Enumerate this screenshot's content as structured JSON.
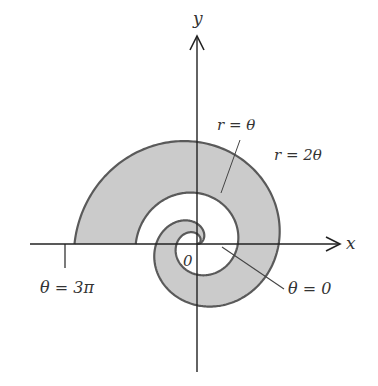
{
  "figure": {
    "type": "polar-region-diagram",
    "axes": {
      "x_label": "x",
      "y_label": "y",
      "origin_label": "0"
    },
    "curves": [
      {
        "label": "r = θ",
        "equation": "r = theta"
      },
      {
        "label": "r = 2θ",
        "equation": "r = 2 theta"
      }
    ],
    "annotations": [
      {
        "label": "θ = 3π",
        "position": "negative x-axis"
      },
      {
        "label": "θ = 0",
        "position": "positive x-axis"
      }
    ],
    "theta_range": [
      "0",
      "3π"
    ],
    "colors": {
      "fill": "#c8c8c8",
      "curve": "#555555",
      "axis": "#222222"
    }
  }
}
